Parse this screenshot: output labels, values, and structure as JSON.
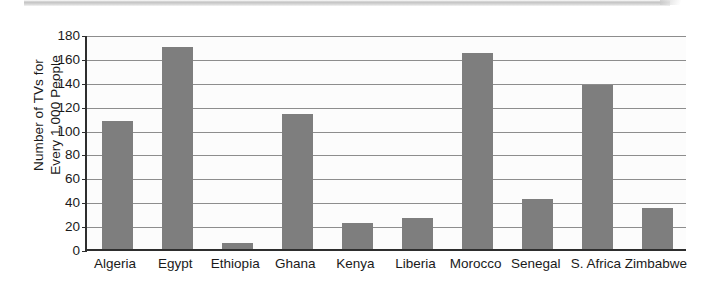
{
  "chart_data": {
    "type": "bar",
    "title": "",
    "xlabel": "",
    "ylabel": "Number of TVs for Every 1,000 People",
    "ylabel_lines": [
      "Number of TVs for",
      "Every 1,000 People"
    ],
    "categories": [
      "Algeria",
      "Egypt",
      "Ethiopia",
      "Ghana",
      "Kenya",
      "Liberia",
      "Morocco",
      "Senegal",
      "S. Africa",
      "Zimbabwe"
    ],
    "values": [
      107,
      169,
      5,
      113,
      22,
      26,
      164,
      42,
      137,
      34
    ],
    "ylim": [
      0,
      180
    ],
    "yticks": [
      0,
      20,
      40,
      60,
      80,
      100,
      120,
      140,
      160,
      180
    ],
    "ytick_labels": [
      "0",
      "20",
      "40",
      "60",
      "80",
      "100",
      "120",
      "140",
      "160",
      "180"
    ],
    "grid": true,
    "legend": false,
    "bar_color": "#7e7e7e",
    "axis_color": "#2e2e2e",
    "gridline_color": "#8d8d8d",
    "plot_background": "#fcfcfc"
  }
}
